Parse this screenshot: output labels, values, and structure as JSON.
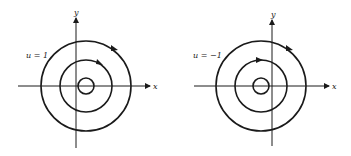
{
  "panels": [
    {
      "id": "left",
      "parameter_label": "u = 1",
      "x_axis_label": "x",
      "y_axis_label": "y",
      "orientation": "clockwise",
      "circles": [
        {
          "r": 8
        },
        {
          "r": 26
        },
        {
          "r": 45
        }
      ]
    },
    {
      "id": "right",
      "parameter_label": "u = −1",
      "x_axis_label": "x",
      "y_axis_label": "y",
      "orientation": "clockwise",
      "circles": [
        {
          "r": 8
        },
        {
          "r": 26
        },
        {
          "r": 45
        }
      ]
    }
  ],
  "colors": {
    "stroke": "#1a1a1a",
    "background": "#ffffff"
  }
}
